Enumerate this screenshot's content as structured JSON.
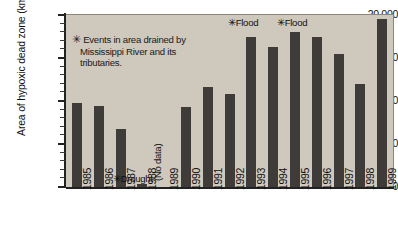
{
  "chart_data": {
    "type": "bar",
    "title": "",
    "xlabel": "",
    "ylabel": "Area of hypoxic dead zone (km",
    "ylabel_superscript": "2",
    "ylabel_suffix": ")",
    "categories": [
      "1985",
      "1986",
      "1987",
      "1988",
      "1989",
      "1990",
      "1991",
      "1992",
      "1993",
      "1994",
      "1995",
      "1996",
      "1997",
      "1998",
      "1999"
    ],
    "values": [
      9800,
      9400,
      6800,
      400,
      null,
      9300,
      11600,
      10800,
      17500,
      16300,
      18000,
      17400,
      15500,
      12000,
      19500
    ],
    "ylim": [
      0,
      20000
    ],
    "ytick_values": [
      0,
      5000,
      10000,
      15000,
      20000
    ],
    "ytick_labels": [
      "0",
      "5,000",
      "10,000",
      "15,000",
      "20,000"
    ],
    "minor_tick_interval": 1000,
    "grid": false,
    "legend_position": "none",
    "bar_color": "#3e3b38",
    "plot_background": "#cfc8bd",
    "annotations": [
      {
        "id": "footnote",
        "text": "Events in area drained by Mississippi River and its tributaries.",
        "marker": "✳"
      },
      {
        "id": "drought-1988",
        "text": "Drought",
        "marker": "✳",
        "category": "1988"
      },
      {
        "id": "flood-1993",
        "text": "Flood",
        "marker": "✳",
        "category": "1993"
      },
      {
        "id": "flood-1995",
        "text": "Flood",
        "marker": "✳",
        "category": "1995"
      },
      {
        "id": "nodata-1989",
        "text": "(No data)",
        "marker": "",
        "category": "1989"
      }
    ]
  },
  "labels": {
    "footnote_line1": "Events in area drained by",
    "footnote_line2": "Mississippi River and its",
    "footnote_line3": "tributaries.",
    "asterisk": "✳",
    "drought": "Drought",
    "flood_1993": "Flood",
    "flood_1995": "Flood",
    "no_data": "(No data)"
  }
}
